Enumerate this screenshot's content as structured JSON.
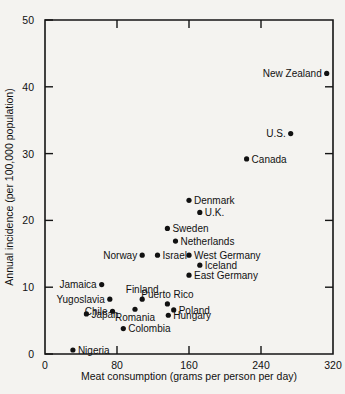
{
  "chart_data": {
    "type": "scatter",
    "title": "",
    "xlabel": "Meat consumption (grams per person per day)",
    "ylabel": "Annual incidence (per 100,000 population)",
    "xlim": [
      0,
      320
    ],
    "ylim": [
      0,
      50
    ],
    "xticks": [
      "0",
      "80",
      "160",
      "240",
      "320"
    ],
    "xtick_values": [
      0,
      80,
      160,
      240,
      320
    ],
    "yticks": [
      "0",
      "10",
      "20",
      "30",
      "40",
      "50"
    ],
    "ytick_values": [
      0,
      10,
      20,
      30,
      40,
      50
    ],
    "grid": false,
    "legend": "none",
    "marker": "filled-circle",
    "points": [
      {
        "label": "New Zealand",
        "x": 313,
        "y": 42.0,
        "side": "left"
      },
      {
        "label": "U.S.",
        "x": 273,
        "y": 33.0,
        "side": "left"
      },
      {
        "label": "Canada",
        "x": 224,
        "y": 29.2,
        "side": "right"
      },
      {
        "label": "Denmark",
        "x": 160,
        "y": 23.0,
        "side": "right"
      },
      {
        "label": "U.K.",
        "x": 172,
        "y": 21.2,
        "side": "right"
      },
      {
        "label": "Sweden",
        "x": 136,
        "y": 18.8,
        "side": "right"
      },
      {
        "label": "Netherlands",
        "x": 145,
        "y": 16.9,
        "side": "right"
      },
      {
        "label": "Israel",
        "x": 125,
        "y": 14.8,
        "side": "right"
      },
      {
        "label": "West Germany",
        "x": 160,
        "y": 14.8,
        "side": "right"
      },
      {
        "label": "Norway",
        "x": 108,
        "y": 14.8,
        "side": "left"
      },
      {
        "label": "Iceland",
        "x": 172,
        "y": 13.3,
        "side": "right"
      },
      {
        "label": "East Germany",
        "x": 160,
        "y": 11.8,
        "side": "right"
      },
      {
        "label": "Jamaica",
        "x": 63,
        "y": 10.4,
        "side": "left"
      },
      {
        "label": "Yugoslavia",
        "x": 72,
        "y": 8.2,
        "side": "left"
      },
      {
        "label": "Finland",
        "x": 108,
        "y": 8.2,
        "side": "above"
      },
      {
        "label": "Puerto Rico",
        "x": 136,
        "y": 7.5,
        "side": "above"
      },
      {
        "label": "Poland",
        "x": 143,
        "y": 6.6,
        "side": "right"
      },
      {
        "label": "Chile",
        "x": 75,
        "y": 6.4,
        "side": "left"
      },
      {
        "label": "Romania",
        "x": 100,
        "y": 6.7,
        "side": "below"
      },
      {
        "label": "Hungary",
        "x": 137,
        "y": 5.8,
        "side": "right"
      },
      {
        "label": "Japan",
        "x": 46,
        "y": 6.0,
        "side": "right"
      },
      {
        "label": "Colombia",
        "x": 87,
        "y": 3.8,
        "side": "right"
      },
      {
        "label": "Nigeria",
        "x": 31,
        "y": 0.6,
        "side": "right"
      }
    ]
  },
  "colors": {
    "background": "#f4f3f0",
    "axis": "#151515",
    "marker": "#111111",
    "text": "#111111"
  }
}
